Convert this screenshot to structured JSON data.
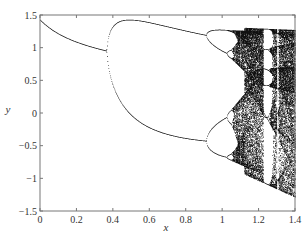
{
  "chart_data": {
    "type": "scatter",
    "title": "",
    "xlabel": "x",
    "ylabel": "y",
    "xlim": [
      0,
      1.4
    ],
    "ylim": [
      -1.5,
      1.5
    ],
    "xticks": [
      0,
      0.2,
      0.4,
      0.6,
      0.8,
      1,
      1.2,
      1.4
    ],
    "xtick_labels": [
      "0",
      "0.2",
      "0.4",
      "0.6",
      "0.8",
      "1",
      "1.2",
      "1.4"
    ],
    "yticks": [
      1.5,
      1,
      0.5,
      0,
      -0.5,
      -1,
      -1.5
    ],
    "ytick_labels": [
      "1.5",
      "1",
      "0.5",
      "0",
      "−0.5",
      "−1",
      "−1.5"
    ],
    "grid": false,
    "legend": null,
    "map": {
      "name": "henon",
      "b": 0.3,
      "x_start": 0.0,
      "x_end": 1.4
    },
    "features": [
      {
        "label": "fixed point branch",
        "x_range": [
          0,
          0.37
        ],
        "y_start": 1.33,
        "y_end": 0.92
      },
      {
        "label": "period-2 onset",
        "x": 0.37
      },
      {
        "label": "period-4 onset",
        "x": 0.91
      },
      {
        "label": "chaos onset",
        "x": 1.06
      },
      {
        "label": "periodic window",
        "x": 1.225
      }
    ],
    "point_color": "#111111"
  }
}
